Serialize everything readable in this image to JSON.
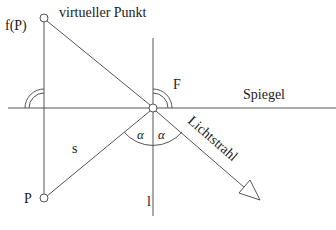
{
  "diagram": {
    "type": "mirror-reflection",
    "labels": {
      "virtual_point_fn": "f(P)",
      "virtual_point": "virtueller Punkt",
      "point": "P",
      "reflection_point": "F",
      "mirror": "Spiegel",
      "segment": "s",
      "normal": "l",
      "angle_left": "α",
      "angle_right": "α",
      "ray": "Lichtstrahl"
    },
    "colors": {
      "line": "#555555",
      "text": "#1a1a1a",
      "background": "#ffffff"
    }
  }
}
